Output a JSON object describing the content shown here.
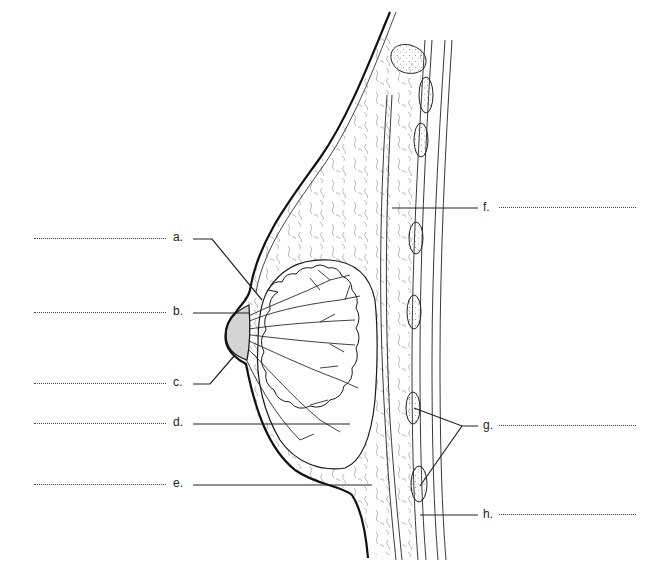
{
  "figure": {
    "colors": {
      "outline": "#1a1a1a",
      "tissue_texture": "#9a9a9a",
      "nipple_areola_fill": "#d4d4d4",
      "background": "#ffffff"
    }
  },
  "labels": {
    "a": {
      "letter": "a.",
      "side": "left",
      "answer": ""
    },
    "b": {
      "letter": "b.",
      "side": "left",
      "answer": ""
    },
    "c": {
      "letter": "c.",
      "side": "left",
      "answer": ""
    },
    "d": {
      "letter": "d.",
      "side": "left",
      "answer": ""
    },
    "e": {
      "letter": "e.",
      "side": "left",
      "answer": ""
    },
    "f": {
      "letter": "f.",
      "side": "right",
      "answer": ""
    },
    "g": {
      "letter": "g.",
      "side": "right",
      "answer": ""
    },
    "h": {
      "letter": "h.",
      "side": "right",
      "answer": ""
    }
  }
}
